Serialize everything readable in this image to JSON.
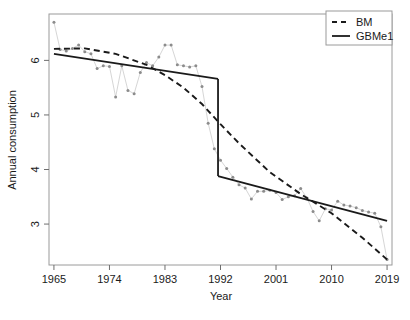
{
  "chart_data": {
    "type": "scatter",
    "title": "",
    "subtitle": "",
    "xlabel": "Year",
    "ylabel": "Annual consumption",
    "xlim": [
      1964.2,
      2019.8
    ],
    "ylim": [
      2.25,
      6.85
    ],
    "xticks": [
      1965,
      1974,
      1983,
      1992,
      2001,
      2010,
      2019
    ],
    "xtick_labels": [
      "1965",
      "1974",
      "1983",
      "1992",
      "2001",
      "2010",
      "2019"
    ],
    "yticks": [
      3,
      4,
      5,
      6
    ],
    "ytick_labels": [
      "3",
      "4",
      "5",
      "6"
    ],
    "grid": false,
    "legend_position": "top-right",
    "colors": {
      "points": "#8c8c8c",
      "point_line": "#d6d6d6",
      "bm_line": "#1a1a1a",
      "gbme1_line": "#1a1a1a",
      "axis": "#6e6e6e",
      "frame": "#9a9a9a",
      "text": "#1a1a1a",
      "background": "#ffffff"
    },
    "observed": {
      "name": "Observed annual consumption",
      "marker": "point",
      "x": [
        1965,
        1966,
        1967,
        1968,
        1969,
        1970,
        1971,
        1972,
        1973,
        1974,
        1975,
        1976,
        1977,
        1978,
        1979,
        1980,
        1981,
        1982,
        1983,
        1984,
        1985,
        1986,
        1987,
        1988,
        1989,
        1990,
        1991,
        1992,
        1993,
        1994,
        1995,
        1996,
        1997,
        1998,
        1999,
        2000,
        2001,
        2002,
        2003,
        2004,
        2005,
        2006,
        2007,
        2008,
        2009,
        2010,
        2011,
        2012,
        2013,
        2014,
        2015,
        2016,
        2017,
        2018,
        2019
      ],
      "y": [
        6.7,
        6.2,
        6.17,
        6.22,
        6.28,
        6.16,
        6.12,
        5.85,
        5.9,
        5.89,
        5.33,
        5.9,
        5.45,
        5.39,
        5.78,
        5.96,
        5.9,
        6.06,
        6.28,
        6.28,
        5.92,
        5.9,
        5.88,
        5.9,
        5.52,
        4.85,
        4.38,
        4.17,
        4.02,
        3.86,
        3.72,
        3.66,
        3.46,
        3.6,
        3.6,
        3.62,
        3.58,
        3.45,
        3.5,
        3.52,
        3.65,
        3.48,
        3.23,
        3.06,
        3.28,
        3.26,
        3.42,
        3.35,
        3.33,
        3.3,
        3.25,
        3.22,
        3.2,
        2.95,
        2.35
      ]
    },
    "series": [
      {
        "name": "BM",
        "type": "line",
        "style": "dashed",
        "x": [
          1965,
          1970,
          1975,
          1980,
          1983,
          1986,
          1989,
          1992,
          1995,
          2000,
          2005,
          2010,
          2015,
          2019
        ],
        "y": [
          6.21,
          6.22,
          6.12,
          5.92,
          5.73,
          5.5,
          5.2,
          4.83,
          4.48,
          3.95,
          3.55,
          3.2,
          2.75,
          2.35
        ]
      },
      {
        "name": "GBMe1",
        "type": "line",
        "style": "solid",
        "breakpoint_year": 1991.6,
        "segments": [
          {
            "x": [
              1965,
              1991.6
            ],
            "y": [
              6.12,
              5.66
            ]
          },
          {
            "x": [
              1991.6,
              2019
            ],
            "y": [
              3.88,
              3.06
            ]
          }
        ]
      }
    ],
    "legend": [
      {
        "label": "BM",
        "style": "dashed"
      },
      {
        "label": "GBMe1",
        "style": "solid"
      }
    ]
  }
}
